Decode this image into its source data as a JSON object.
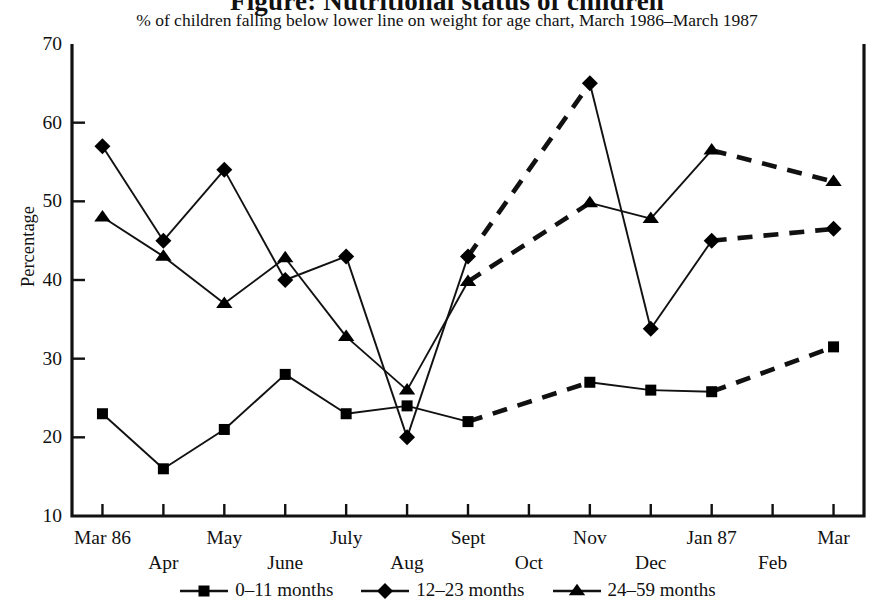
{
  "title": "Figure: Nutritional status of children",
  "subtitle": "% of children falling below lower line on weight for age chart, March 1986–March 1987",
  "axis": {
    "ylabel": "Percentage",
    "yticks": [
      "70",
      "60",
      "50",
      "40",
      "30",
      "20",
      "10"
    ],
    "xlabels_top": [
      "Mar 86",
      "May",
      "July",
      "Sept",
      "Nov",
      "Jan 87",
      "Mar"
    ],
    "xlabels_bottom": [
      "Apr",
      "June",
      "Aug",
      "Oct",
      "Dec",
      "Feb"
    ]
  },
  "legend": {
    "items": [
      {
        "label": "0–11 months",
        "marker": "square"
      },
      {
        "label": "12–23 months",
        "marker": "diamond"
      },
      {
        "label": "24–59 months",
        "marker": "triangle"
      }
    ]
  },
  "chart_data": {
    "type": "line",
    "title": "Figure: Nutritional status of children",
    "subtitle": "% of children falling below lower line on weight for age chart, March 1986–March 1987",
    "xlabel": "",
    "ylabel": "Percentage",
    "ylim": [
      10,
      70
    ],
    "ytick_step": 10,
    "grid": false,
    "legend_position": "bottom",
    "categories": [
      "Mar 86",
      "Apr",
      "May",
      "June",
      "July",
      "Aug",
      "Sept",
      "Oct",
      "Nov",
      "Dec",
      "Jan 87",
      "Feb",
      "Mar"
    ],
    "dashed_from_index": 6,
    "series": [
      {
        "name": "0–11 months",
        "marker": "square",
        "values": [
          23,
          16,
          21,
          28,
          23,
          24,
          22,
          null,
          27,
          26,
          25.8,
          null,
          31.5
        ]
      },
      {
        "name": "12–23 months",
        "marker": "diamond",
        "values": [
          57,
          45,
          54,
          40,
          43,
          20,
          43,
          null,
          65,
          33.8,
          45,
          null,
          46.5
        ]
      },
      {
        "name": "24–59 months",
        "marker": "triangle",
        "values": [
          48,
          43,
          37,
          42.8,
          32.8,
          26,
          39.8,
          null,
          49.8,
          47.8,
          56.5,
          null,
          52.5
        ]
      }
    ]
  }
}
